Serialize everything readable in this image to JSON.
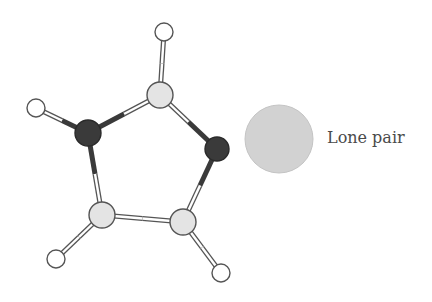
{
  "diagram": {
    "type": "molecule-ball-and-stick",
    "label": "Lone pair",
    "colors": {
      "dark_atom": "#3a3a3a",
      "light_atom": "#e4e4e4",
      "hydrogen": "#ffffff",
      "outline": "#555555",
      "lone_pair": "#d2d2d2"
    },
    "atoms": [
      {
        "id": "C_top",
        "kind": "light",
        "x": 160,
        "y": 95,
        "r": 13
      },
      {
        "id": "N_left",
        "kind": "dark",
        "x": 88,
        "y": 133,
        "r": 13
      },
      {
        "id": "N_right",
        "kind": "dark",
        "x": 217,
        "y": 149,
        "r": 12
      },
      {
        "id": "C_bl",
        "kind": "light",
        "x": 102,
        "y": 215,
        "r": 13
      },
      {
        "id": "C_br",
        "kind": "light",
        "x": 183,
        "y": 222,
        "r": 13
      },
      {
        "id": "H_top",
        "kind": "hydrogen",
        "x": 164,
        "y": 32,
        "r": 9
      },
      {
        "id": "H_left",
        "kind": "hydrogen",
        "x": 36,
        "y": 108,
        "r": 9
      },
      {
        "id": "H_bl",
        "kind": "hydrogen",
        "x": 56,
        "y": 259,
        "r": 9
      },
      {
        "id": "H_br",
        "kind": "hydrogen",
        "x": 221,
        "y": 273,
        "r": 9
      }
    ],
    "bonds": [
      [
        "C_top",
        "N_left"
      ],
      [
        "C_top",
        "N_right"
      ],
      [
        "N_left",
        "C_bl"
      ],
      [
        "N_right",
        "C_br"
      ],
      [
        "C_bl",
        "C_br"
      ],
      [
        "C_top",
        "H_top"
      ],
      [
        "N_left",
        "H_left"
      ],
      [
        "C_bl",
        "H_bl"
      ],
      [
        "C_br",
        "H_br"
      ]
    ],
    "lone_pair": {
      "x": 279,
      "y": 139,
      "r": 34
    }
  }
}
